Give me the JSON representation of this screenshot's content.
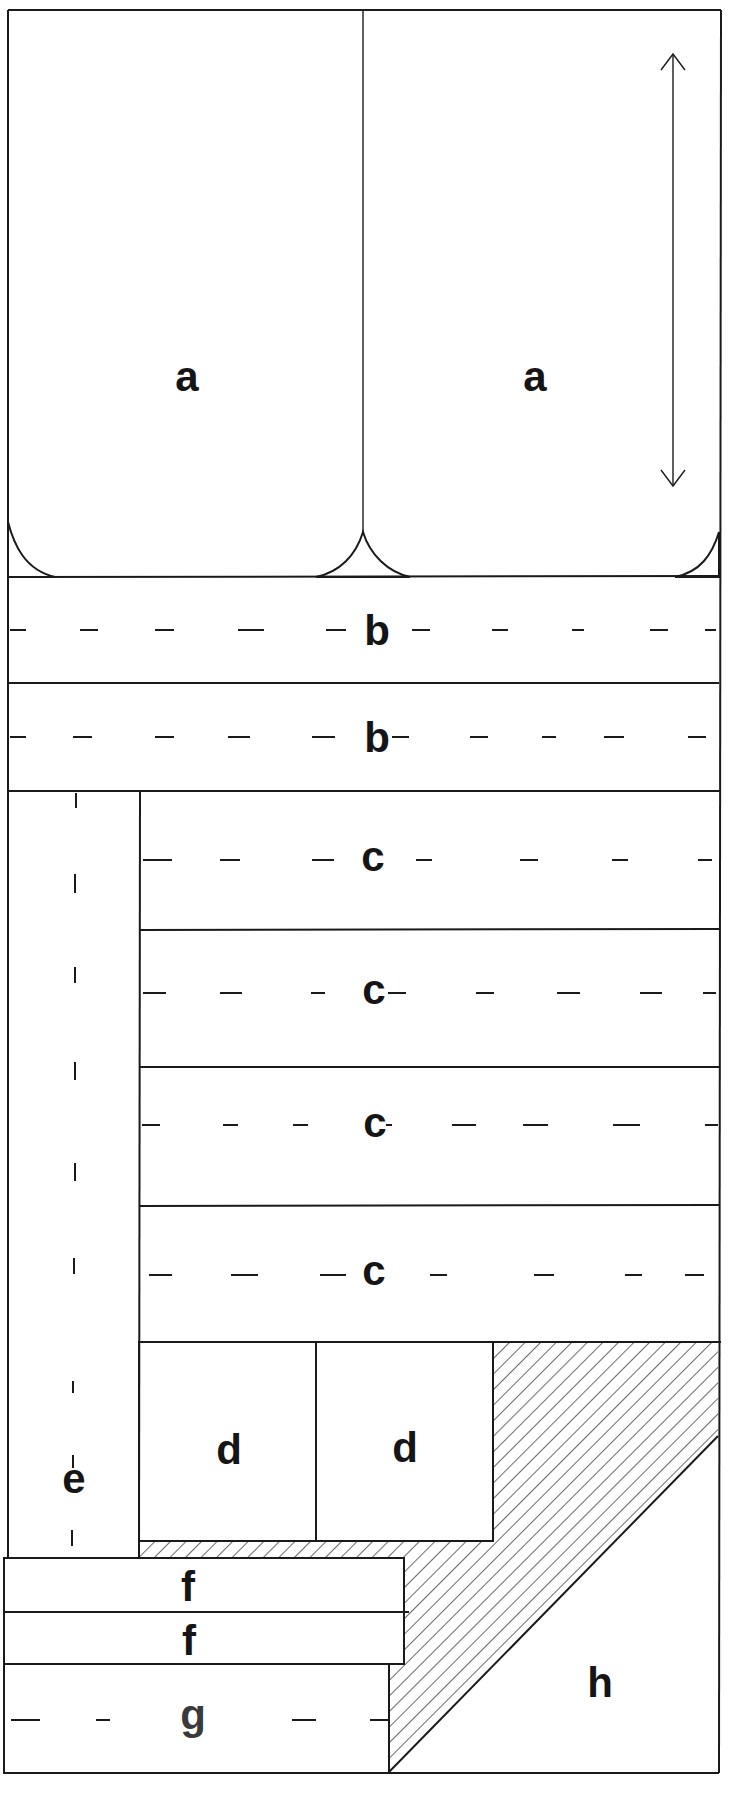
{
  "diagram": {
    "type": "floor-plan-layout",
    "stroke_color": "#1a1a1a",
    "background": "#ffffff",
    "labels": {
      "a1": "a",
      "a2": "a",
      "b1": "b",
      "b2": "b",
      "c1": "c",
      "c2": "c",
      "c3": "c",
      "c4": "c",
      "d1": "d",
      "d2": "d",
      "e": "e",
      "f1": "f",
      "f2": "f",
      "g": "g",
      "h": "h"
    },
    "regions": [
      {
        "id": "a1",
        "label": "a",
        "kind": "bay",
        "hatched_corners": true
      },
      {
        "id": "a2",
        "label": "a",
        "kind": "bay",
        "hatched_corners": true
      },
      {
        "id": "b1",
        "label": "b",
        "kind": "lane",
        "dashed_centerline": true
      },
      {
        "id": "b2",
        "label": "b",
        "kind": "lane",
        "dashed_centerline": true
      },
      {
        "id": "c1",
        "label": "c",
        "kind": "lane",
        "dashed_centerline": true
      },
      {
        "id": "c2",
        "label": "c",
        "kind": "lane",
        "dashed_centerline": true
      },
      {
        "id": "c3",
        "label": "c",
        "kind": "lane",
        "dashed_centerline": true
      },
      {
        "id": "c4",
        "label": "c",
        "kind": "lane",
        "dashed_centerline": true
      },
      {
        "id": "d1",
        "label": "d",
        "kind": "block"
      },
      {
        "id": "d2",
        "label": "d",
        "kind": "block"
      },
      {
        "id": "e",
        "label": "e",
        "kind": "vertical-lane",
        "dashed_centerline": true
      },
      {
        "id": "f1",
        "label": "f",
        "kind": "strip"
      },
      {
        "id": "f2",
        "label": "f",
        "kind": "strip"
      },
      {
        "id": "g",
        "label": "g",
        "kind": "lane",
        "dashed_centerline": true
      },
      {
        "id": "h",
        "label": "h",
        "kind": "triangular-area"
      },
      {
        "id": "hatched-zone",
        "label": "",
        "kind": "hatched-area"
      }
    ],
    "annotations": [
      {
        "id": "double-arrow",
        "kind": "vertical-double-headed-arrow",
        "region": "a2"
      }
    ]
  }
}
